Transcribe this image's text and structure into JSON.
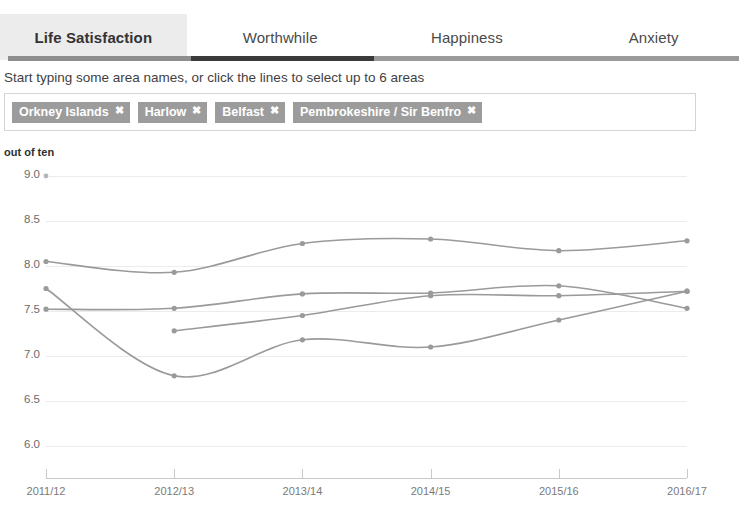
{
  "tabs": [
    {
      "label": "Life Satisfaction",
      "active": true
    },
    {
      "label": "Worthwhile",
      "active": false
    },
    {
      "label": "Happiness",
      "active": false
    },
    {
      "label": "Anxiety",
      "active": false
    }
  ],
  "help_text": "Start typing some area names, or click the lines to select up to 6 areas",
  "tags": [
    {
      "label": "Orkney Islands",
      "remove": "✖"
    },
    {
      "label": "Harlow",
      "remove": "✖"
    },
    {
      "label": "Belfast",
      "remove": "✖"
    },
    {
      "label": "Pembrokeshire / Sir Benfro",
      "remove": "✖"
    }
  ],
  "colors": {
    "line": "#9a9a9a",
    "marker": "#9a9a9a",
    "grid": "#ececec",
    "tag_bg": "#9c9c9c",
    "tab_active_bg": "#ececec",
    "underline_dark": "#3a3a3a",
    "underline_light": "#8e8e8e"
  },
  "chart_data": {
    "type": "line",
    "title": "",
    "xlabel": "",
    "ylabel": "out of ten",
    "ylim": [
      5.75,
      9.1
    ],
    "yticks": [
      "9.0",
      "8.5",
      "8.0",
      "7.5",
      "7.0",
      "6.5",
      "6.0"
    ],
    "ytick_values": [
      9.0,
      8.5,
      8.0,
      7.5,
      7.0,
      6.5,
      6.0
    ],
    "grid": true,
    "legend": "none",
    "categories": [
      "2011/12",
      "2012/13",
      "2013/14",
      "2014/15",
      "2015/16",
      "2016/17"
    ],
    "series": [
      {
        "name": "Orkney Islands",
        "values": [
          8.05,
          7.93,
          8.25,
          8.3,
          8.17,
          8.28
        ]
      },
      {
        "name": "Harlow",
        "values": [
          7.75,
          6.78,
          7.18,
          7.1,
          7.4,
          7.72
        ]
      },
      {
        "name": "Belfast",
        "values": [
          7.52,
          7.53,
          7.69,
          7.7,
          7.78,
          7.53
        ]
      },
      {
        "name": "Pembrokeshire / Sir Benfro",
        "values": [
          null,
          7.28,
          7.45,
          7.67,
          7.67,
          7.72
        ]
      }
    ]
  }
}
